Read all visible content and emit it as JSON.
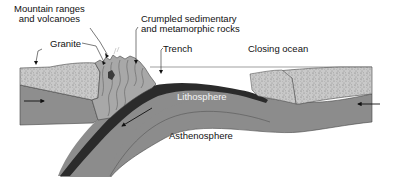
{
  "diagram": {
    "type": "cross-section",
    "labels": {
      "mountains_line1": "Mountain ranges",
      "mountains_line2": "and volcanoes",
      "granite": "Granite",
      "crumpled_line1": "Crumpled sedimentary",
      "crumpled_line2": "and metamorphic rocks",
      "trench": "Trench",
      "closing_ocean": "Closing ocean",
      "lithosphere": "Lithosphere",
      "asthenosphere": "Asthenosphere"
    },
    "arrows": [
      {
        "name": "left-plate-motion",
        "direction": "right"
      },
      {
        "name": "right-plate-motion",
        "direction": "left"
      },
      {
        "name": "subduction-motion",
        "direction": "down-left"
      }
    ],
    "colors": {
      "lithosphere": "#8c8c8c",
      "oceanic_crust": "#2a2a2a",
      "continental_crust": "#c8c8c8",
      "mountains": "#a9a9a9",
      "ocean_water": "#ffffff",
      "outline": "#333333"
    }
  }
}
